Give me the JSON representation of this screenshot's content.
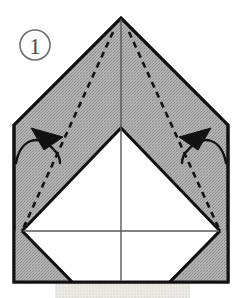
{
  "figure": {
    "step_number": "1",
    "step_number_display": "①"
  },
  "colors": {
    "paper_shaded": "#a9a9a9",
    "paper_shaded_dither": "#9a9a9a",
    "paper_white": "#ffffff",
    "outline": "#111111",
    "crease_line": "#555555",
    "fold_dashed": "#111111",
    "arrow": "#111111",
    "step_number": "#4a4a4a",
    "shadow": "#e2e1dd",
    "background": "#ffffff"
  },
  "shapes": {
    "outer_paper": {
      "name": "pentagon-house-outline",
      "points": "121,18 228,125 228,282 14,282 14,125",
      "fill": "shaded"
    },
    "white_diamond": {
      "name": "white-inner-diamond",
      "points": "121,128 220,231 121,282 22,231",
      "fill": "white"
    },
    "bottom_white_rect": {
      "name": "white-lower-band",
      "points": "22,231 220,231 220,282 22,282",
      "fill": "white"
    }
  },
  "lines": {
    "center_vertical": {
      "name": "center-crease",
      "x1": 121,
      "y1": 18,
      "x2": 121,
      "y2": 282
    },
    "horizontal_crease": {
      "name": "horizontal-crease",
      "x1": 22,
      "y1": 231,
      "x2": 220,
      "y2": 231
    }
  },
  "fold_lines": [
    {
      "name": "left-valley-fold",
      "x1": 113,
      "y1": 32,
      "x2": 22,
      "y2": 231,
      "style": "dashed"
    },
    {
      "name": "right-valley-fold",
      "x1": 129,
      "y1": 32,
      "x2": 220,
      "y2": 231,
      "style": "dashed"
    }
  ],
  "arrows": [
    {
      "name": "left-fold-arrow",
      "direction": "up-left",
      "path": "M 17,161 C 24,139 44,133 59,157",
      "head_points": "35,128 62,136 46,148"
    },
    {
      "name": "right-fold-arrow",
      "direction": "up-right",
      "path": "M 225,161 C 218,139 198,133 183,157",
      "head_points": "207,128 180,136 196,148"
    }
  ],
  "shadow": {
    "name": "drop-shadow-band",
    "x": 55,
    "y": 283,
    "width": 135,
    "height": 15
  },
  "labels": {
    "step_badge": {
      "name": "step-number-badge",
      "cx": 35,
      "cy": 45,
      "r": 15
    }
  }
}
